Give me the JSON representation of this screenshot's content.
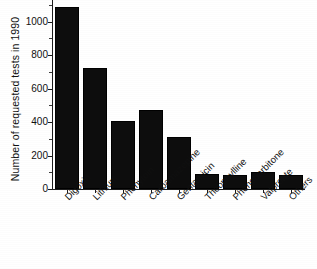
{
  "chart_data": {
    "type": "bar",
    "title": "",
    "subtitle": "",
    "xlabel": "",
    "ylabel": "Number of requested tests in 1990",
    "categories": [
      "Digoxin",
      "Lithium",
      "Phenytoin",
      "Carbamazepine",
      "Gentamicin",
      "Theophylline",
      "Phenobarbitone",
      "Valproate",
      "Others"
    ],
    "values": [
      1090,
      725,
      405,
      475,
      310,
      90,
      85,
      100,
      85
    ],
    "ylim": [
      0,
      1130
    ],
    "yticks": [
      0,
      200,
      400,
      600,
      800,
      1000
    ],
    "ytick_labels": [
      "0",
      "200",
      "400",
      "600",
      "800",
      "1000"
    ],
    "grid": false,
    "legend": null,
    "legend_position": "none",
    "bar_color": "#0d0d0d",
    "axis_color": "#1d1d1d",
    "background_color": "#ffffff",
    "xtick_label_rotation": -45,
    "annotations": []
  }
}
